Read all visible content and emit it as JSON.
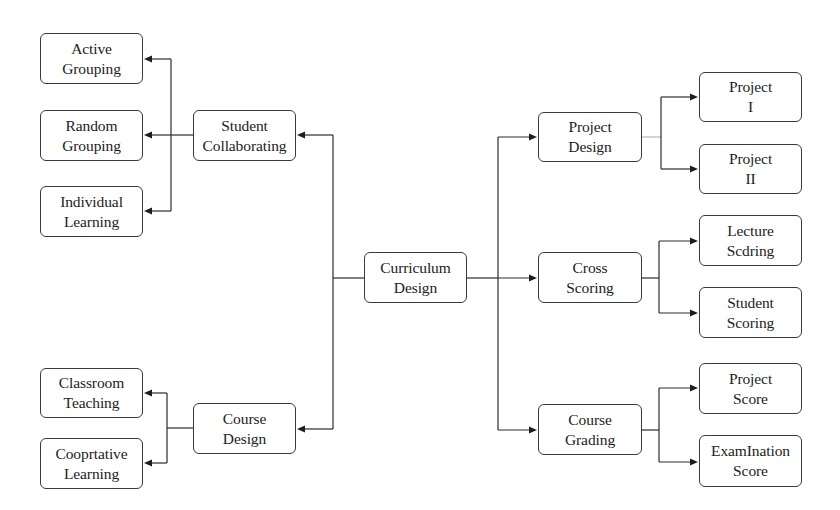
{
  "diagram": {
    "root": {
      "id": "curriculum-design",
      "line1": "Curriculum",
      "line2": "Design"
    },
    "left_branches": [
      {
        "id": "student-collaborating",
        "line1": "Student",
        "line2": "Collaborating",
        "children": [
          {
            "id": "active-grouping",
            "line1": "Active",
            "line2": "Grouping"
          },
          {
            "id": "random-grouping",
            "line1": "Random",
            "line2": "Grouping"
          },
          {
            "id": "individual-learning",
            "line1": "Individual",
            "line2": "Learning"
          }
        ]
      },
      {
        "id": "course-design",
        "line1": "Course",
        "line2": "Design",
        "children": [
          {
            "id": "classroom-teaching",
            "line1": "Classroom",
            "line2": "Teaching"
          },
          {
            "id": "cooprtative-learning",
            "line1": "Cooprtative",
            "line2": "Learning"
          }
        ]
      }
    ],
    "right_branches": [
      {
        "id": "project-design",
        "line1": "Project",
        "line2": "Design",
        "children": [
          {
            "id": "project-1",
            "line1": "Project",
            "line2": "I"
          },
          {
            "id": "project-2",
            "line1": "Project",
            "line2": "II"
          }
        ]
      },
      {
        "id": "cross-scoring",
        "line1": "Cross",
        "line2": "Scoring",
        "children": [
          {
            "id": "lecture-scoring",
            "line1": "Lecture",
            "line2": "Scdring"
          },
          {
            "id": "student-scoring",
            "line1": "Student",
            "line2": "Scoring"
          }
        ]
      },
      {
        "id": "course-grading",
        "line1": "Course",
        "line2": "Grading",
        "children": [
          {
            "id": "project-score",
            "line1": "Project",
            "line2": "Score"
          },
          {
            "id": "examination-score",
            "line1": "ExamInation",
            "line2": "Score"
          }
        ]
      }
    ],
    "colors": {
      "stroke": "#3a3a3a",
      "text": "#1c1c1c",
      "background": "#ffffff"
    }
  }
}
